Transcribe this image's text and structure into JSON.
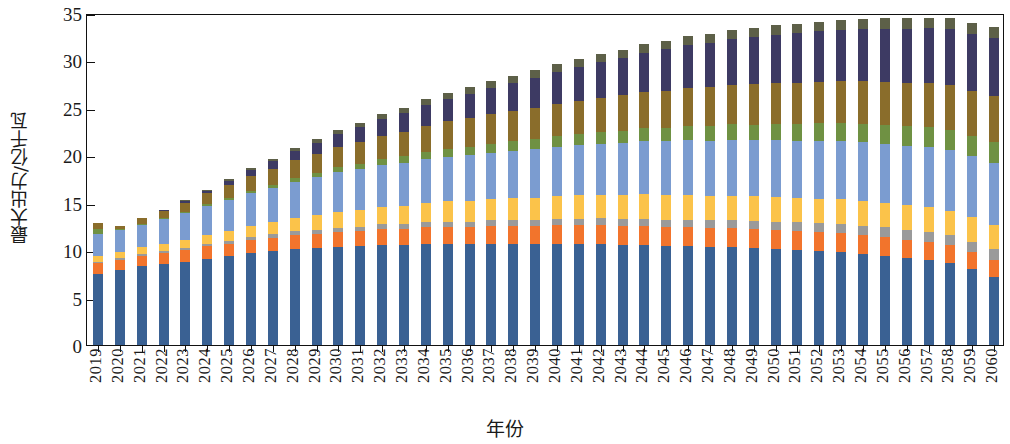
{
  "chart_data": {
    "type": "bar",
    "stacked": true,
    "title": "",
    "xlabel": "年份",
    "ylabel": "最大出力/亿千瓦",
    "ylim": [
      0,
      35
    ],
    "yticks": [
      0,
      5,
      10,
      15,
      20,
      25,
      30,
      35
    ],
    "ytick_labels": [
      "0",
      "5",
      "10",
      "15",
      "20",
      "25",
      "30",
      "35"
    ],
    "grid": false,
    "legend": "none",
    "categories": [
      "2019",
      "2020",
      "2021",
      "2022",
      "2023",
      "2024",
      "2025",
      "2026",
      "2027",
      "2028",
      "2029",
      "2030",
      "2031",
      "2032",
      "2033",
      "2034",
      "2035",
      "2036",
      "2037",
      "2038",
      "2039",
      "2040",
      "2041",
      "2042",
      "2043",
      "2044",
      "2045",
      "2046",
      "2047",
      "2048",
      "2049",
      "2050",
      "2051",
      "2052",
      "2053",
      "2054",
      "2055",
      "2056",
      "2057",
      "2058",
      "2059",
      "2060"
    ],
    "series": [
      {
        "name": "coal",
        "color": "#3a6193",
        "values": [
          7.5,
          7.9,
          8.3,
          8.5,
          8.8,
          9.1,
          9.4,
          9.7,
          9.9,
          10.1,
          10.2,
          10.3,
          10.4,
          10.5,
          10.5,
          10.6,
          10.6,
          10.6,
          10.6,
          10.6,
          10.6,
          10.6,
          10.6,
          10.6,
          10.5,
          10.5,
          10.4,
          10.4,
          10.3,
          10.3,
          10.2,
          10.1,
          10.0,
          9.9,
          9.8,
          9.6,
          9.4,
          9.2,
          9.0,
          8.6,
          8.0,
          7.2
        ]
      },
      {
        "name": "gas",
        "color": "#f2742c",
        "values": [
          1.1,
          1.1,
          1.1,
          1.2,
          1.2,
          1.3,
          1.3,
          1.4,
          1.4,
          1.5,
          1.5,
          1.6,
          1.6,
          1.7,
          1.7,
          1.8,
          1.8,
          1.8,
          1.9,
          1.9,
          1.9,
          2.0,
          2.0,
          2.0,
          2.0,
          2.0,
          2.0,
          2.0,
          2.0,
          2.0,
          2.0,
          2.0,
          2.0,
          2.0,
          2.0,
          2.0,
          2.0,
          1.9,
          1.9,
          1.9,
          1.8,
          1.8
        ]
      },
      {
        "name": "nuclear",
        "color": "#9a9a9a",
        "values": [
          0.15,
          0.17,
          0.19,
          0.21,
          0.24,
          0.27,
          0.3,
          0.33,
          0.36,
          0.39,
          0.42,
          0.45,
          0.48,
          0.51,
          0.54,
          0.57,
          0.6,
          0.62,
          0.64,
          0.66,
          0.68,
          0.7,
          0.72,
          0.74,
          0.76,
          0.78,
          0.8,
          0.82,
          0.84,
          0.86,
          0.88,
          0.9,
          0.92,
          0.94,
          0.96,
          0.98,
          1.0,
          1.02,
          1.04,
          1.06,
          1.08,
          1.1
        ]
      },
      {
        "name": "hydro",
        "color": "#fbc34a",
        "values": [
          0.6,
          0.65,
          0.7,
          0.75,
          0.85,
          0.95,
          1.05,
          1.15,
          1.3,
          1.45,
          1.55,
          1.65,
          1.75,
          1.85,
          1.95,
          2.05,
          2.15,
          2.2,
          2.25,
          2.3,
          2.35,
          2.4,
          2.45,
          2.5,
          2.55,
          2.6,
          2.6,
          2.6,
          2.6,
          2.6,
          2.6,
          2.6,
          2.6,
          2.6,
          2.6,
          2.6,
          2.6,
          2.6,
          2.6,
          2.6,
          2.6,
          2.6
        ]
      },
      {
        "name": "wind",
        "color": "#7b9cd0",
        "values": [
          2.4,
          2.3,
          2.4,
          2.6,
          2.8,
          3.0,
          3.2,
          3.4,
          3.6,
          3.8,
          4.0,
          4.2,
          4.3,
          4.4,
          4.5,
          4.6,
          4.7,
          4.8,
          4.9,
          5.0,
          5.1,
          5.2,
          5.3,
          5.4,
          5.5,
          5.6,
          5.7,
          5.8,
          5.8,
          5.9,
          5.9,
          6.0,
          6.0,
          6.1,
          6.1,
          6.2,
          6.2,
          6.3,
          6.3,
          6.4,
          6.4,
          6.5
        ]
      },
      {
        "name": "solar",
        "color": "#6f9143",
        "values": [
          0.45,
          0.1,
          0.12,
          0.15,
          0.18,
          0.22,
          0.26,
          0.3,
          0.35,
          0.4,
          0.46,
          0.52,
          0.58,
          0.64,
          0.7,
          0.76,
          0.82,
          0.88,
          0.94,
          1.0,
          1.06,
          1.12,
          1.18,
          1.24,
          1.3,
          1.36,
          1.42,
          1.48,
          1.54,
          1.6,
          1.66,
          1.72,
          1.78,
          1.84,
          1.9,
          1.96,
          2.0,
          2.05,
          2.1,
          2.15,
          2.2,
          2.25
        ]
      },
      {
        "name": "biomass",
        "color": "#8a6d2b",
        "values": [
          0.7,
          0.35,
          0.55,
          0.75,
          0.95,
          1.15,
          1.35,
          1.55,
          1.7,
          1.85,
          2.0,
          2.15,
          2.3,
          2.45,
          2.6,
          2.75,
          2.9,
          3.0,
          3.1,
          3.2,
          3.3,
          3.4,
          3.5,
          3.6,
          3.7,
          3.8,
          3.9,
          4.0,
          4.1,
          4.2,
          4.25,
          4.3,
          4.35,
          4.4,
          4.45,
          4.5,
          4.55,
          4.6,
          4.65,
          4.7,
          4.75,
          4.8
        ]
      },
      {
        "name": "storage",
        "color": "#3d3a63",
        "values": [
          0.0,
          0.0,
          0.05,
          0.1,
          0.2,
          0.3,
          0.45,
          0.6,
          0.8,
          1.0,
          1.2,
          1.4,
          1.6,
          1.8,
          2.0,
          2.2,
          2.4,
          2.6,
          2.8,
          3.0,
          3.2,
          3.4,
          3.6,
          3.8,
          4.0,
          4.2,
          4.4,
          4.55,
          4.7,
          4.85,
          5.0,
          5.1,
          5.2,
          5.3,
          5.4,
          5.5,
          5.6,
          5.7,
          5.8,
          5.9,
          6.0,
          6.1
        ]
      },
      {
        "name": "other",
        "color": "#5d6048",
        "values": [
          0.0,
          0.0,
          0.0,
          0.0,
          0.05,
          0.1,
          0.15,
          0.2,
          0.25,
          0.3,
          0.35,
          0.4,
          0.45,
          0.5,
          0.55,
          0.6,
          0.65,
          0.7,
          0.72,
          0.74,
          0.76,
          0.78,
          0.8,
          0.82,
          0.84,
          0.86,
          0.88,
          0.9,
          0.92,
          0.94,
          0.96,
          0.98,
          1.0,
          1.02,
          1.04,
          1.06,
          1.08,
          1.1,
          1.12,
          1.14,
          1.16,
          1.18
        ]
      }
    ],
    "totals": [
      12.9,
      12.57,
      13.41,
      14.26,
      15.27,
      16.39,
      17.46,
      18.57,
      19.66,
      20.74,
      21.68,
      22.67,
      23.46,
      24.25,
      24.99,
      25.78,
      26.52,
      27.2,
      27.85,
      28.4,
      28.95,
      29.5,
      30.05,
      30.6,
      31.1,
      31.7,
      32.1,
      32.55,
      32.8,
      33.25,
      33.45,
      33.7,
      33.85,
      34.1,
      34.25,
      34.4,
      34.43,
      34.47,
      34.51,
      34.45,
      33.99,
      33.53
    ]
  }
}
